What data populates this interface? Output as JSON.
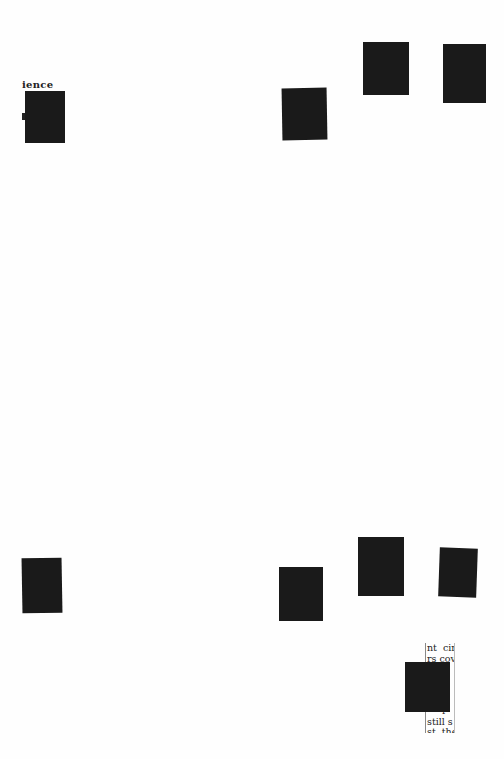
{
  "document": {
    "type": "scanned-page-with-redactions",
    "background": "#fefefe",
    "redaction_color": "#1a1a1a",
    "visible_text_fragments": {
      "top_left": "ience",
      "bottom_right_column": [
        "nt  cir",
        "rs cov",
        "     n",
        "     i",
        "      ",
        "     d",
        "     r",
        "still s",
        "st, the"
      ]
    },
    "redactions": [
      {
        "id": "top-left",
        "x": 25,
        "y": 91,
        "w": 40,
        "h": 52
      },
      {
        "id": "top-mid",
        "x": 282,
        "y": 88,
        "w": 45,
        "h": 52
      },
      {
        "id": "top-right-a",
        "x": 363,
        "y": 42,
        "w": 46,
        "h": 53
      },
      {
        "id": "top-right-b",
        "x": 443,
        "y": 44,
        "w": 43,
        "h": 59
      },
      {
        "id": "bottom-left",
        "x": 22,
        "y": 558,
        "w": 40,
        "h": 55
      },
      {
        "id": "bottom-mid",
        "x": 279,
        "y": 567,
        "w": 44,
        "h": 54
      },
      {
        "id": "bottom-right-a",
        "x": 358,
        "y": 537,
        "w": 46,
        "h": 59
      },
      {
        "id": "bottom-right-b",
        "x": 439,
        "y": 548,
        "w": 38,
        "h": 49
      },
      {
        "id": "bottom-corner",
        "x": 405,
        "y": 662,
        "w": 45,
        "h": 50
      }
    ]
  }
}
